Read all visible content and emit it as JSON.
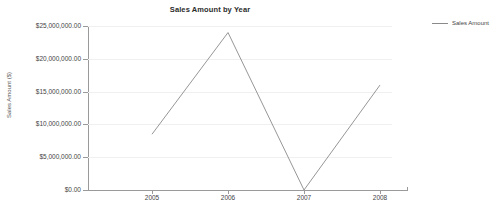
{
  "chart_data": {
    "type": "line",
    "title": "Sales Amount by Year",
    "xlabel": "",
    "ylabel": "Sales Amount ($)",
    "categories": [
      "2005",
      "2006",
      "2007",
      "2008"
    ],
    "series": [
      {
        "name": "Sales Amount",
        "values": [
          8500000,
          24000000,
          0,
          16000000
        ],
        "color": "#8a8a8a"
      }
    ],
    "ylim": [
      0,
      25000000
    ],
    "ytick_values": [
      0,
      5000000,
      10000000,
      15000000,
      20000000,
      25000000
    ],
    "ytick_labels": [
      "$0.00",
      "$5,000,000.00",
      "$10,000,000.00",
      "$15,000,000.00",
      "$20,000,000.00",
      "$25,000,000.00"
    ],
    "grid": true,
    "legend_position": "right"
  },
  "legend": {
    "entries": [
      {
        "label": "Sales Amount",
        "swatch": "line-swatch"
      }
    ]
  },
  "colors": {
    "series_line": "#8a8a8a",
    "axis": "#9a9a9a",
    "gridline": "#f0f0f0",
    "text": "#444444",
    "background": "#ffffff"
  }
}
